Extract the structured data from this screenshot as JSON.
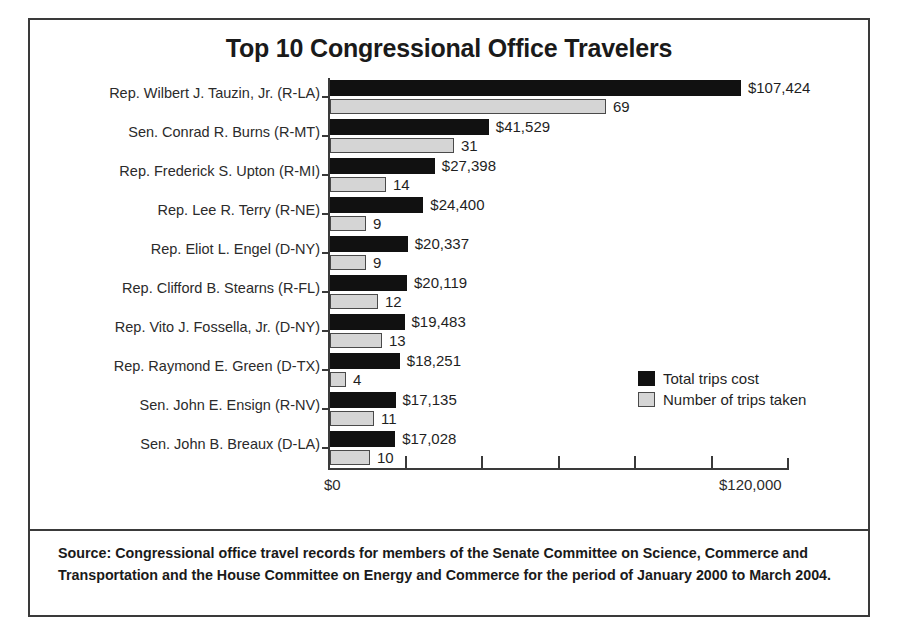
{
  "chart_data": {
    "type": "bar",
    "orientation": "horizontal",
    "title": "Top 10 Congressional Office Travelers",
    "xlabel": "",
    "ylabel": "",
    "grid": false,
    "legend_position": "middle-right",
    "xlim": [
      0,
      120000
    ],
    "xticks": [
      0,
      20000,
      40000,
      60000,
      80000,
      100000,
      120000
    ],
    "xtick_labels_shown": [
      "$0",
      "$120,000"
    ],
    "categories": [
      "Rep. Wilbert J. Tauzin, Jr. (R-LA)",
      "Sen. Conrad R. Burns (R-MT)",
      "Rep. Frederick S. Upton (R-MI)",
      "Rep. Lee R. Terry (R-NE)",
      "Rep. Eliot L. Engel (D-NY)",
      "Rep. Clifford B. Stearns (R-FL)",
      "Rep. Vito J. Fossella, Jr. (D-NY)",
      "Rep. Raymond E. Green (D-TX)",
      "Sen. John E. Ensign (R-NV)",
      "Sen. John B. Breaux (D-LA)"
    ],
    "series": [
      {
        "name": "Total trips cost",
        "color": "#111111",
        "values": [
          107424,
          41529,
          27398,
          24400,
          20337,
          20119,
          19483,
          18251,
          17135,
          17028
        ],
        "labels": [
          "$107,424",
          "$41,529",
          "$27,398",
          "$24,400",
          "$20,337",
          "$20,119",
          "$19,483",
          "$18,251",
          "$17,135",
          "$17,028"
        ]
      },
      {
        "name": "Number of trips taken",
        "color": "#d5d5d5",
        "values": [
          69,
          31,
          14,
          9,
          9,
          12,
          13,
          4,
          11,
          10
        ],
        "labels": [
          "69",
          "31",
          "14",
          "9",
          "9",
          "12",
          "13",
          "4",
          "11",
          "10"
        ]
      }
    ]
  },
  "axis": {
    "x_start_label": "$0",
    "x_end_label": "$120,000"
  },
  "legend": {
    "items": [
      {
        "label": "Total trips cost",
        "color": "#111111"
      },
      {
        "label": "Number of trips taken",
        "color": "#d5d5d5"
      }
    ]
  },
  "source": {
    "text": "Source: Congressional office travel records for members of the Senate Committee on Science, Commerce and Transportation and the House Committee on Energy and Commerce for the period of January 2000 to March 2004."
  }
}
